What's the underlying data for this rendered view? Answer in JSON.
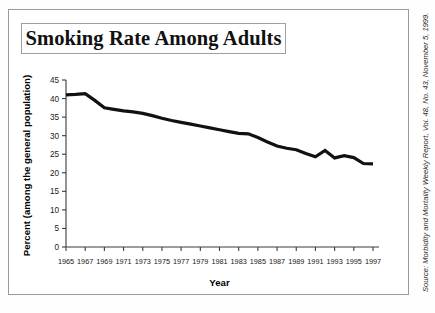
{
  "figure": {
    "title": "Smoking Rate Among Adults",
    "source_credit": "Source: Morbidity and Mortality Weekly Report, Vol. 48, No. 43, November 5, 1999."
  },
  "chart_data": {
    "type": "line",
    "title": "Smoking Rate Among Adults",
    "xlabel": "Year",
    "ylabel": "Percent",
    "ylabel_sub": "(among the general population)",
    "xlim": [
      1965,
      1997
    ],
    "ylim": [
      0,
      45
    ],
    "yticks": [
      0,
      5,
      10,
      15,
      20,
      25,
      30,
      35,
      40,
      45
    ],
    "ytick_labels": [
      "0",
      "5",
      "10",
      "15",
      "20",
      "25",
      "30",
      "35",
      "40",
      "45"
    ],
    "xticks": [
      1965,
      1967,
      1969,
      1971,
      1973,
      1975,
      1977,
      1979,
      1981,
      1983,
      1985,
      1987,
      1989,
      1991,
      1993,
      1995,
      1997
    ],
    "xtick_labels": [
      "1965",
      "1967",
      "1969",
      "1971",
      "1973",
      "1975",
      "1977",
      "1979",
      "1981",
      "1983",
      "1985",
      "1987",
      "1989",
      "1991",
      "1993",
      "1995",
      "1997"
    ],
    "grid": false,
    "legend": false,
    "line_color": "#111111",
    "line_width": 3.2,
    "x": [
      1965,
      1966,
      1967,
      1968,
      1969,
      1970,
      1971,
      1972,
      1973,
      1974,
      1975,
      1976,
      1977,
      1978,
      1979,
      1980,
      1981,
      1982,
      1983,
      1984,
      1985,
      1986,
      1987,
      1988,
      1989,
      1990,
      1991,
      1992,
      1993,
      1994,
      1995,
      1996,
      1997
    ],
    "values": [
      41.0,
      41.1,
      41.3,
      39.5,
      37.5,
      37.1,
      36.7,
      36.4,
      36.0,
      35.4,
      34.7,
      34.1,
      33.6,
      33.1,
      32.6,
      32.1,
      31.6,
      31.1,
      30.6,
      30.5,
      29.5,
      28.3,
      27.2,
      26.6,
      26.2,
      25.2,
      24.3,
      26.0,
      24.0,
      24.6,
      24.1,
      22.5,
      22.4
    ],
    "series_name": "Smoking rate (percent of adults)"
  }
}
